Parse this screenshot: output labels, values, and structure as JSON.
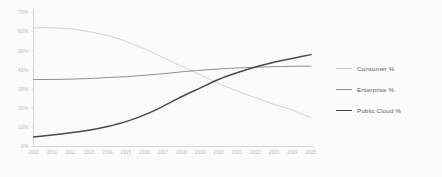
{
  "chart_data": {
    "type": "line",
    "title": "",
    "subtitle": "",
    "xlabel": "",
    "ylabel": "",
    "grid": false,
    "legend_position": "right",
    "xlim": [
      2010,
      2025
    ],
    "ylim": [
      0,
      70
    ],
    "ytick_step": 10,
    "categories": [
      2010,
      2011,
      2012,
      2013,
      2014,
      2015,
      2016,
      2017,
      2018,
      2019,
      2020,
      2021,
      2022,
      2023,
      2024,
      2025
    ],
    "x_tick_labels": [
      "2010",
      "2011",
      "2012",
      "2013",
      "2014",
      "2015",
      "2016",
      "2017",
      "2018",
      "2019",
      "2020",
      "2021",
      "2022",
      "2023",
      "2024",
      "2025"
    ],
    "y_tick_labels": [
      "0%",
      "10%",
      "20%",
      "30%",
      "40%",
      "50%",
      "60%",
      "70%"
    ],
    "y_tick_values": [
      0,
      10,
      20,
      30,
      40,
      50,
      60,
      70
    ],
    "series": [
      {
        "name": "Consumer %",
        "color": "#c8c8c8",
        "width": 0.9,
        "values": [
          62,
          62,
          61.5,
          60,
          58,
          55,
          51,
          46.5,
          42,
          37.5,
          33,
          29,
          25.5,
          22,
          19,
          15
        ]
      },
      {
        "name": "Enterprise %",
        "color": "#8c8c8c",
        "width": 1.0,
        "values": [
          35,
          35,
          35.2,
          35.5,
          36,
          36.5,
          37.2,
          38,
          39,
          39.8,
          40.5,
          41,
          41.4,
          41.7,
          41.9,
          42
        ]
      },
      {
        "name": "Public Cloud %",
        "color": "#4a4a4a",
        "width": 1.5,
        "values": [
          5,
          6,
          7.2,
          8.5,
          10.5,
          13,
          16.5,
          21,
          26,
          30.5,
          35,
          38.5,
          41.5,
          44,
          46,
          48
        ]
      }
    ]
  },
  "legend": {
    "items": [
      {
        "label": "Consumer %"
      },
      {
        "label": "Enterprise %"
      },
      {
        "label": "Public Cloud %"
      }
    ]
  },
  "axes": {
    "axis_color": "#cfcfcf",
    "tick_text_color": "#b9b9b9"
  }
}
